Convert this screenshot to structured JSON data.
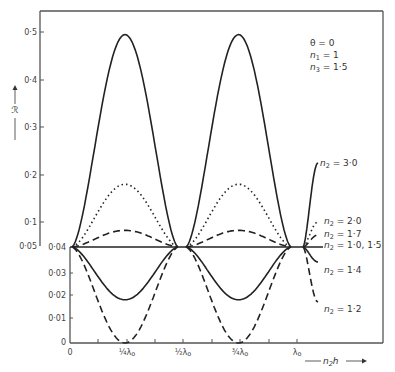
{
  "chart_data": {
    "type": "line",
    "title": "",
    "xlabel": "n2h",
    "ylabel": "R",
    "conditions": [
      "θ = 0",
      "n1 = 1",
      "n3 = 1·5"
    ],
    "x_ticks": [
      {
        "label": "0",
        "value": 0
      },
      {
        "label": "¼λ0",
        "value": 0.25
      },
      {
        "label": "½λ0",
        "value": 0.5
      },
      {
        "label": "¾λ0",
        "value": 0.75
      },
      {
        "label": "λ0",
        "value": 1.0
      }
    ],
    "y_axis_upper": {
      "range": [
        0.05,
        0.5
      ],
      "ticks": [
        "0.5",
        "0.4",
        "0.3",
        "0.2",
        "0.1",
        "0.05"
      ]
    },
    "y_axis_lower": {
      "range": [
        0,
        0.04
      ],
      "ticks": [
        "0.04",
        "0.03",
        "0.02",
        "0.01",
        "0"
      ]
    },
    "x_unit": "λ0",
    "series": [
      {
        "name": "n2 = 3·0",
        "style": "solid",
        "peak": 0.495,
        "peak_at": [
          0.25,
          0.75
        ],
        "min": 0.04
      },
      {
        "name": "n2 = 2·0",
        "style": "dotted",
        "peak": 0.18,
        "peak_at": [
          0.25,
          0.75
        ],
        "min": 0.04
      },
      {
        "name": "n2 = 1·7",
        "style": "dashed",
        "peak": 0.083,
        "peak_at": [
          0.25,
          0.75
        ],
        "min": 0.04
      },
      {
        "name": "n2 = 1·0, 1·5",
        "style": "solid",
        "constant": 0.04
      },
      {
        "name": "n2 = 1·4",
        "style": "solid",
        "min": 0.018,
        "min_at": [
          0.25,
          0.75
        ],
        "max": 0.04
      },
      {
        "name": "n2 = 1·2",
        "style": "dashed",
        "min": 0.0,
        "min_at": [
          0.25,
          0.75
        ],
        "max": 0.04
      }
    ],
    "grid": false,
    "legend_position": "inline-right"
  },
  "labels": {
    "theta": "θ = 0",
    "n1": "n",
    "n1_sub": "1",
    "n1_val": " = 1",
    "n3": "n",
    "n3_sub": "3",
    "n3_val": " = 1·5",
    "ylabel": "ℛ",
    "xlabel_n": "n",
    "xlabel_sub": "2",
    "xlabel_h": "h",
    "s30": " = 3·0",
    "s20": " = 2·0",
    "s17": " = 1·7",
    "s1015": " = 1·0, 1·5",
    "s14": " = 1·4",
    "s12": " = 1·2",
    "n": "n",
    "two": "2",
    "yu": [
      "0·5",
      "0·4",
      "0·3",
      "0·2",
      "0·1",
      "0·05"
    ],
    "yl": [
      "0·04",
      "0·03",
      "0·02",
      "0·01",
      "0"
    ],
    "x0": "0",
    "xq1": "¼λ",
    "xq2": "½λ",
    "xq3": "¾λ",
    "xl": "λ",
    "o": "o"
  }
}
